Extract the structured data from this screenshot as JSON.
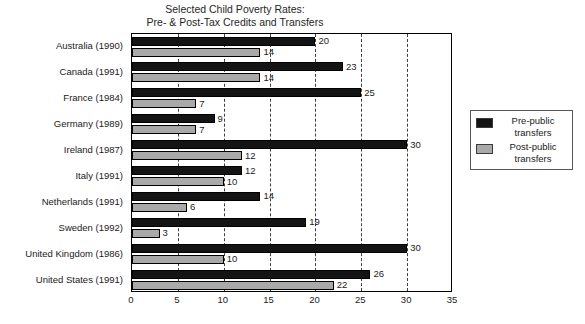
{
  "chart_data": {
    "type": "bar",
    "orientation": "horizontal",
    "title": "Selected Child Poverty Rates:",
    "subtitle": "Pre- & Post-Tax Credits and Transfers",
    "title_lines": [
      "Selected Child Poverty Rates:",
      "Pre- & Post-Tax Credits and Transfers"
    ],
    "xlabel": "",
    "ylabel": "",
    "xlim": [
      0,
      35
    ],
    "ylim": null,
    "grid": true,
    "grid_axis": "x",
    "legend_position": "right",
    "xticks": [
      0,
      5,
      10,
      15,
      20,
      25,
      30,
      35
    ],
    "xtick_labels": [
      "0",
      "5",
      "10",
      "15",
      "20",
      "25",
      "30",
      "35"
    ],
    "categories": [
      "Australia (1990)",
      "Canada (1991)",
      "France (1984)",
      "Germany (1989)",
      "Ireland (1987)",
      "Italy (1991)",
      "Netherlands (1991)",
      "Sweden (1992)",
      "United Kingdom (1986)",
      "United States (1991)"
    ],
    "series": [
      {
        "name": "Pre-public transfers",
        "color": "#141414",
        "values": [
          20,
          23,
          25,
          9,
          30,
          12,
          14,
          19,
          30,
          26
        ],
        "labels": [
          "20",
          "23",
          "25",
          "9",
          "30",
          "12",
          "14",
          "19",
          "30",
          "26"
        ]
      },
      {
        "name": "Post-public transfers",
        "color": "#a9a9a9",
        "values": [
          14,
          14,
          7,
          7,
          12,
          10,
          6,
          3,
          10,
          22
        ],
        "labels": [
          "14",
          "14",
          "7",
          "7",
          "12",
          "10",
          "6",
          "3",
          "10",
          "22"
        ]
      }
    ]
  },
  "legend": {
    "items": [
      {
        "label_line1": "Pre-public",
        "label_line2": "transfers",
        "swatch": "pre"
      },
      {
        "label_line1": "Post-public",
        "label_line2": "transfers",
        "swatch": "post"
      }
    ]
  }
}
